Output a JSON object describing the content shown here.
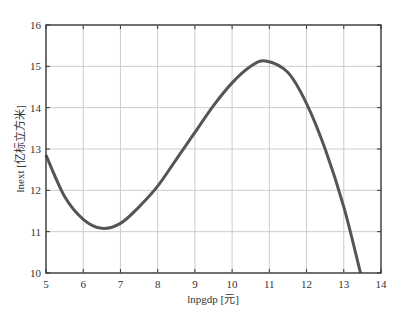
{
  "chart_data": {
    "type": "line",
    "title": "",
    "xlabel": "lnpgdp [元]",
    "ylabel": "lnext [亿标立方米]",
    "xlim": [
      5,
      14
    ],
    "ylim": [
      10,
      16
    ],
    "xticks": [
      5,
      6,
      7,
      8,
      9,
      10,
      11,
      12,
      13,
      14
    ],
    "yticks": [
      10,
      11,
      12,
      13,
      14,
      15,
      16
    ],
    "grid": true,
    "legend": null,
    "series": [
      {
        "name": "fitted curve",
        "color": "#555555",
        "x": [
          5.0,
          5.5,
          6.0,
          6.5,
          7.0,
          7.5,
          8.0,
          8.5,
          9.0,
          9.5,
          10.0,
          10.5,
          10.9,
          11.5,
          12.0,
          12.5,
          13.0,
          13.45
        ],
        "y": [
          12.85,
          11.85,
          11.3,
          11.08,
          11.2,
          11.6,
          12.1,
          12.75,
          13.4,
          14.05,
          14.6,
          15.0,
          15.13,
          14.85,
          14.1,
          13.0,
          11.6,
          10.0
        ]
      }
    ]
  },
  "colors": {
    "axis": "#333333",
    "grid": "#cccccc",
    "line": "#555555"
  }
}
